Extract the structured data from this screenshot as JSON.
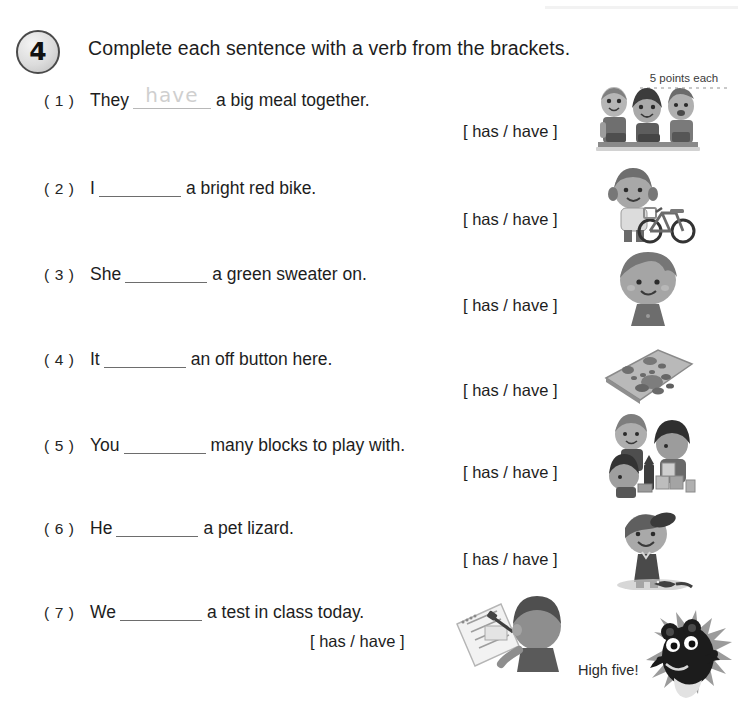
{
  "header": {
    "exercise_number": "4",
    "instruction": "Complete each sentence with a verb from the brackets.",
    "points_label": "5 points each"
  },
  "questions": [
    {
      "number": "( 1 )",
      "before": "They",
      "answer": "have",
      "after": "a big meal together.",
      "brackets": "[ has / have ]",
      "illustration": "three-friends-meal-illustration"
    },
    {
      "number": "( 2 )",
      "before": "I",
      "answer": "",
      "after": "a bright red bike.",
      "brackets": "[ has / have ]",
      "illustration": "girl-with-bike-illustration"
    },
    {
      "number": "( 3 )",
      "before": "She",
      "answer": "",
      "after": "a green sweater on.",
      "brackets": "[ has / have ]",
      "illustration": "girl-with-sweater-illustration"
    },
    {
      "number": "( 4 )",
      "before": "It",
      "answer": "",
      "after": "an off button here.",
      "brackets": "[ has / have ]",
      "illustration": "remote-control-illustration"
    },
    {
      "number": "( 5 )",
      "before": "You",
      "answer": "",
      "after": "many blocks to play with.",
      "brackets": "[ has / have ]",
      "illustration": "children-blocks-illustration"
    },
    {
      "number": "( 6 )",
      "before": "He",
      "answer": "",
      "after": "a pet lizard.",
      "brackets": "[ has / have ]",
      "illustration": "boy-with-lizard-illustration"
    },
    {
      "number": "( 7 )",
      "before": "We",
      "answer": "",
      "after": "a test in class today.",
      "brackets": "[ has / have ]",
      "illustration": "student-taking-test-illustration"
    }
  ],
  "footer": {
    "high_five_label": "High five!",
    "mascot": "hedgehog-mascot"
  },
  "colors": {
    "text": "#1d1d1d",
    "blank_rule": "#6d6d6d",
    "sample_answer": "#cfcfcf",
    "badge_border": "#4a4a4a",
    "art_gray": "#8f8f8f"
  }
}
